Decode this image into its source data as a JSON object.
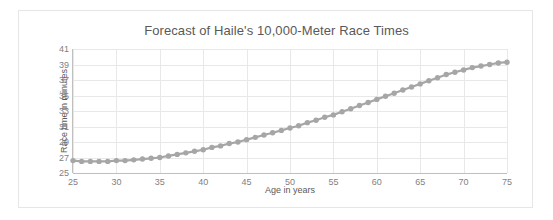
{
  "chart_data": {
    "type": "scatter",
    "title": "Forecast of Haile's 10,000-Meter Race Times",
    "xlabel": "Age in years",
    "ylabel": "Race time in minutes",
    "xlim": [
      25,
      75
    ],
    "ylim": [
      25,
      41
    ],
    "xticks": [
      25,
      30,
      35,
      40,
      45,
      50,
      55,
      60,
      65,
      70,
      75
    ],
    "yticks": [
      25,
      27,
      29,
      31,
      33,
      35,
      37,
      39,
      41
    ],
    "grid": true,
    "legend": "none",
    "marker": "circle",
    "marker_color": "#a6a6a6",
    "line_color": "#a6a6a6",
    "x": [
      25,
      26,
      27,
      28,
      29,
      30,
      31,
      32,
      33,
      34,
      35,
      36,
      37,
      38,
      39,
      40,
      41,
      42,
      43,
      44,
      45,
      46,
      47,
      48,
      49,
      50,
      51,
      52,
      53,
      54,
      55,
      56,
      57,
      58,
      59,
      60,
      61,
      62,
      63,
      64,
      65,
      66,
      67,
      68,
      69,
      70,
      71,
      72,
      73,
      74,
      75
    ],
    "values": [
      26.6,
      26.5,
      26.5,
      26.5,
      26.5,
      26.6,
      26.6,
      26.7,
      26.8,
      26.9,
      27.0,
      27.2,
      27.4,
      27.6,
      27.8,
      28.0,
      28.3,
      28.5,
      28.8,
      29.0,
      29.3,
      29.6,
      29.9,
      30.2,
      30.5,
      30.8,
      31.1,
      31.5,
      31.8,
      32.2,
      32.5,
      32.9,
      33.3,
      33.7,
      34.1,
      34.5,
      34.9,
      35.3,
      35.7,
      36.1,
      36.5,
      36.9,
      37.3,
      37.7,
      38.0,
      38.3,
      38.6,
      38.8,
      39.0,
      39.2,
      39.3
    ]
  }
}
